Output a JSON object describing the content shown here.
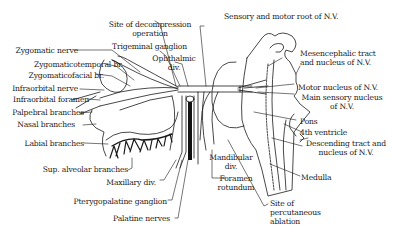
{
  "diagram": {
    "labels": {
      "site_decompression": [
        "Site of decompression",
        "operation"
      ],
      "trigeminal_ganglion": "Trigeminal ganglion",
      "ophthalmic_div": [
        "Ophthalmic",
        "div."
      ],
      "sensory_motor_root": "Sensory and motor root of N.V.",
      "zygomatic_nerve": "Zygomatic nerve",
      "zygomaticotemporal": "Zygomaticotemporal br.",
      "zygomaticofacial": "Zygomaticofacial br.",
      "infraorbital_nerve": "Infraorbital nerve",
      "infraorbital_foramen": "Infraorbital foramen",
      "palpebral_branches": "Palpebral branches",
      "nasal_branches": "Nasal branches",
      "labial_branches": "Labial branches",
      "sup_alveolar": "Sup. alveolar branches",
      "maxillary_div": "Maxillary div.",
      "pterygopalatine": "Pterygopalatine ganglion",
      "palatine_nerves": "Palatine nerves",
      "mesencephalic": [
        "Mesencephalic tract",
        "and nucleus of N.V."
      ],
      "motor_nucleus": "Motor nucleus of N.V.",
      "main_sensory": [
        "Main sensory nucleus",
        "of N.V."
      ],
      "pons": "Pons",
      "fourth_ventricle": "4th ventricle",
      "descending_tract": [
        "Descending tract and",
        "nucleus of N.V."
      ],
      "medulla": "Medulla",
      "mandibular_div": [
        "Mandibular",
        "div."
      ],
      "foramen_rotundum": [
        "Foramen",
        "rotundum"
      ],
      "site_percutaneous": [
        "Site of",
        "percutaneous",
        "ablation"
      ]
    }
  }
}
